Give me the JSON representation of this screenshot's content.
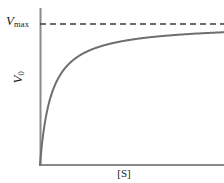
{
  "figure": {
    "title": "",
    "background_color": "#ffffff",
    "line_color": "#6e6e6e",
    "axis_color": "#808080",
    "text_color": "#1a1a1a"
  },
  "labels": {
    "vmax_symbol": "V",
    "vmax_subscript": "max",
    "y_symbol": "V",
    "y_subscript": "0",
    "x_label": "[S]"
  },
  "chart_data": {
    "type": "line",
    "title": "",
    "xlabel": "[S]",
    "ylabel": "V0",
    "xlim": [
      0,
      10
    ],
    "ylim": [
      0,
      1.08
    ],
    "grid": false,
    "legend": null,
    "annotations": [
      {
        "text": "Vmax",
        "type": "asymptote-label",
        "y": 1.0,
        "position": "left-of-y-axis"
      }
    ],
    "series": [
      {
        "name": "Michaelis-Menten curve",
        "equation": "v = Vmax * [S] / (Km + [S])",
        "Vmax": 1.0,
        "Km": 0.62,
        "style": "solid",
        "color": "#6e6e6e",
        "x": [
          0,
          0.1,
          0.2,
          0.3,
          0.4,
          0.5,
          0.62,
          0.8,
          1.0,
          1.3,
          1.6,
          2.0,
          2.5,
          3.0,
          3.5,
          4.0,
          5.0,
          6.0,
          7.0,
          8.0,
          9.0,
          10.0
        ],
        "y": [
          0.0,
          0.139,
          0.244,
          0.326,
          0.392,
          0.446,
          0.5,
          0.563,
          0.617,
          0.677,
          0.721,
          0.763,
          0.801,
          0.829,
          0.849,
          0.866,
          0.89,
          0.906,
          0.919,
          0.928,
          0.935,
          0.942
        ]
      },
      {
        "name": "Vmax asymptote",
        "style": "dashed",
        "color": "#3c3c3c",
        "y_constant": 1.0,
        "x": [
          0,
          10
        ]
      }
    ]
  },
  "geometry": {
    "origin_x": 40,
    "origin_y": 165,
    "x_axis_end": 224,
    "y_axis_top": 8,
    "asymptote_y": 24
  }
}
